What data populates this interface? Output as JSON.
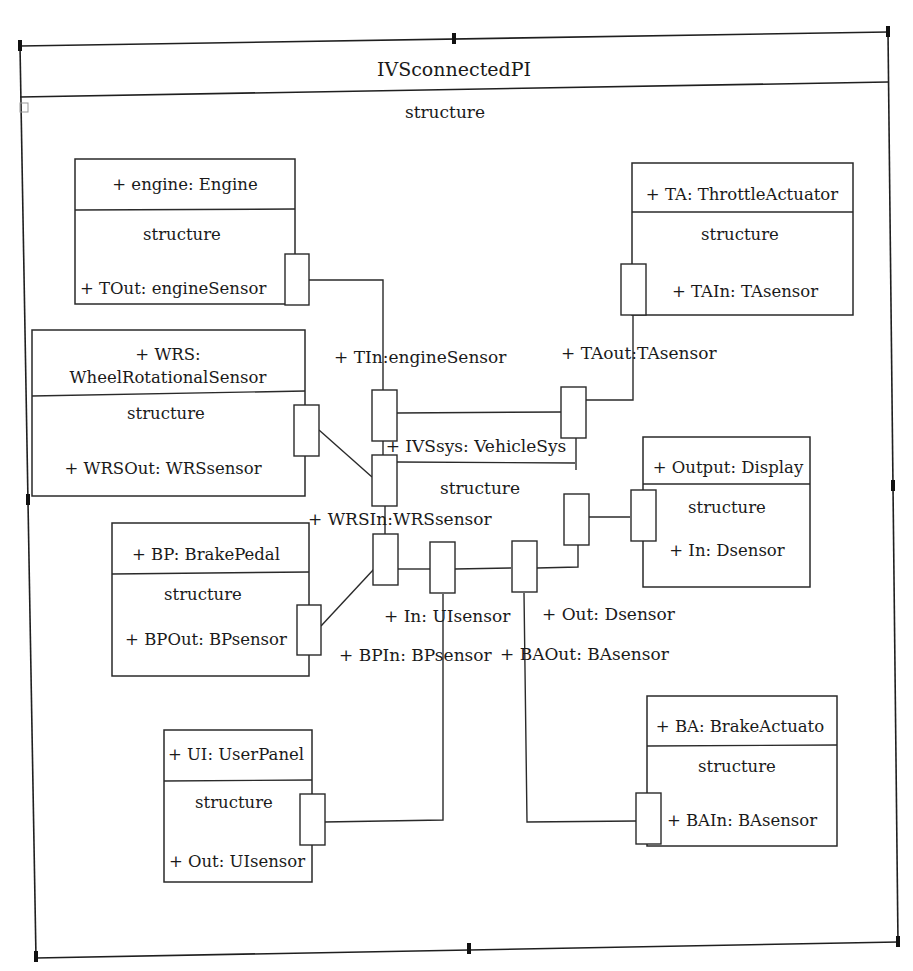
{
  "diagram": {
    "title": "IVSconnectedPI",
    "compartment_label": "structure",
    "parts": [
      {
        "id": "engine",
        "title_lines": [
          "+ engine: Engine"
        ],
        "compartment": "structure",
        "port_label": "+ TOut: engineSensor"
      },
      {
        "id": "throttle-actuator",
        "title_lines": [
          "+ TA: ThrottleActuator"
        ],
        "compartment": "structure",
        "port_label": "+ TAIn: TAsensor"
      },
      {
        "id": "wheel-rotational-sensor",
        "title_lines": [
          "+ WRS:",
          "WheelRotationalSensor"
        ],
        "compartment": "structure",
        "port_label": "+ WRSOut: WRSsensor"
      },
      {
        "id": "output-display",
        "title_lines": [
          "+ Output: Display"
        ],
        "compartment": "structure",
        "port_label": "+ In: Dsensor"
      },
      {
        "id": "brake-pedal",
        "title_lines": [
          "+ BP: BrakePedal"
        ],
        "compartment": "structure",
        "port_label": "+ BPOut: BPsensor"
      },
      {
        "id": "user-panel",
        "title_lines": [
          "+ UI: UserPanel"
        ],
        "compartment": "structure",
        "port_label": "+ Out: UIsensor"
      },
      {
        "id": "brake-actuator",
        "title_lines": [
          "+ BA: BrakeActuato"
        ],
        "compartment": "structure",
        "port_label": "+ BAIn: BAsensor"
      }
    ],
    "central_part": {
      "id": "ivs-sys",
      "title": "+ IVSsys: VehicleSys",
      "compartment": "structure"
    },
    "port_labels": {
      "tin": "+ TIn:engineSensor",
      "taout": "+ TAout:TAsensor",
      "wrsin": "+ WRSIn:WRSsensor",
      "in_ui": "+ In: UIsensor",
      "out_d": "+ Out: Dsensor",
      "bpin": "+ BPIn: BPsensor",
      "baout": "+ BAOut: BAsensor"
    }
  }
}
